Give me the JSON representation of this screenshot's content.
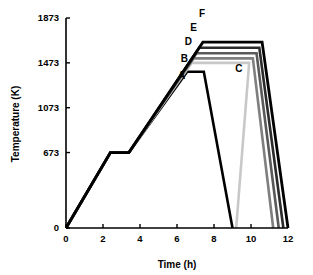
{
  "chart_data": {
    "type": "line",
    "title": "",
    "xlabel": "Time (h)",
    "ylabel": "Temperature (K)",
    "xlim": [
      0,
      12
    ],
    "ylim": [
      0,
      1873
    ],
    "xticks": [
      0,
      2,
      4,
      6,
      8,
      10,
      12
    ],
    "xtick_labels": [
      "0",
      "2",
      "4",
      "6",
      "8",
      "10",
      "12"
    ],
    "yticks": [
      0,
      673,
      1073,
      1473,
      1873
    ],
    "ytick_labels": [
      "0",
      "673",
      "1073",
      "1473",
      "1873"
    ],
    "grid": false,
    "legend": "inline-labels",
    "series": [
      {
        "name": "A",
        "label": "A",
        "color": "#000000",
        "width": 2.6,
        "points": [
          [
            0,
            0
          ],
          [
            2.4,
            673
          ],
          [
            3.4,
            673
          ],
          [
            6.55,
            1393
          ],
          [
            7.45,
            1393
          ],
          [
            9.0,
            0
          ]
        ]
      },
      {
        "name": "B",
        "label": "B",
        "color": "#c8c8c8",
        "width": 2.6,
        "points": [
          [
            0,
            0
          ],
          [
            2.4,
            673
          ],
          [
            3.4,
            673
          ],
          [
            6.8,
            1473
          ],
          [
            9.9,
            1473
          ],
          [
            9.2,
            0
          ]
        ]
      },
      {
        "name": "C",
        "label": "C",
        "color": "#7f7f7f",
        "width": 2.6,
        "points": [
          [
            0,
            0
          ],
          [
            2.4,
            673
          ],
          [
            3.4,
            673
          ],
          [
            6.9,
            1513
          ],
          [
            10.1,
            1513
          ],
          [
            11.2,
            0
          ]
        ]
      },
      {
        "name": "D",
        "label": "D",
        "color": "#5a5a5a",
        "width": 2.6,
        "points": [
          [
            0,
            0
          ],
          [
            2.4,
            673
          ],
          [
            3.4,
            673
          ],
          [
            7.05,
            1558
          ],
          [
            10.3,
            1558
          ],
          [
            11.5,
            0
          ]
        ]
      },
      {
        "name": "E",
        "label": "E",
        "color": "#2b2b2b",
        "width": 2.6,
        "points": [
          [
            0,
            0
          ],
          [
            2.4,
            673
          ],
          [
            3.4,
            673
          ],
          [
            7.2,
            1608
          ],
          [
            10.45,
            1608
          ],
          [
            11.75,
            0
          ]
        ]
      },
      {
        "name": "F",
        "label": "F",
        "color": "#000000",
        "width": 2.8,
        "points": [
          [
            0,
            0
          ],
          [
            2.4,
            673
          ],
          [
            3.4,
            673
          ],
          [
            7.4,
            1658
          ],
          [
            10.6,
            1658
          ],
          [
            12.0,
            0
          ]
        ]
      }
    ],
    "annotations": [
      {
        "text": "A",
        "x": 6.25,
        "y": 1330
      },
      {
        "text": "B",
        "x": 6.4,
        "y": 1480
      },
      {
        "text": "C",
        "x": 9.35,
        "y": 1395
      },
      {
        "text": "D",
        "x": 6.62,
        "y": 1628
      },
      {
        "text": "E",
        "x": 6.9,
        "y": 1760
      },
      {
        "text": "F",
        "x": 7.35,
        "y": 1885
      }
    ]
  },
  "axes": {
    "x_title": "Time (h)",
    "y_title": "Temperature (K)"
  }
}
